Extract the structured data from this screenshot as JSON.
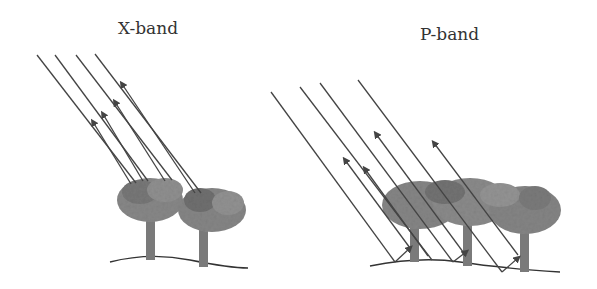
{
  "panels": [
    {
      "title": "X-band"
    },
    {
      "title": "P-band"
    }
  ],
  "colors": {
    "line": "#444444",
    "canopy": "#8a8a8a",
    "canopy_dark": "#6e6e6e",
    "trunk": "#7a7a7a",
    "ground": "#333333"
  }
}
